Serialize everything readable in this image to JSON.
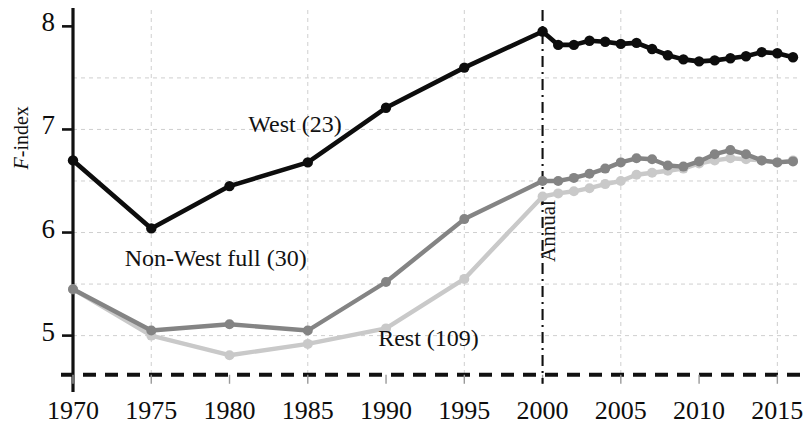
{
  "chart_data": {
    "type": "line",
    "title": "",
    "xlabel": "",
    "ylabel": "F-index",
    "ylabel_prefix": "F",
    "ylabel_suffix": "-index",
    "xlim": [
      1970,
      2016
    ],
    "ylim": [
      4.55,
      8.12
    ],
    "yticks": [
      5,
      6,
      7,
      8
    ],
    "ytick_labels": [
      "5",
      "6",
      "7",
      "8"
    ],
    "xticks": [
      1970,
      1975,
      1980,
      1985,
      1990,
      1995,
      2000,
      2005,
      2010,
      2015
    ],
    "xtick_labels": [
      "1970",
      "1975",
      "1980",
      "1985",
      "1990",
      "1995",
      "2000",
      "2005",
      "2010",
      "2015"
    ],
    "grid": true,
    "gridlines_y": [
      5.0,
      5.5,
      6.0,
      6.5,
      7.0,
      7.5
    ],
    "gridlines_x": [
      1975,
      1985,
      1995,
      2005,
      2015
    ],
    "legend_position": "inline-annotations",
    "baseline_y": 4.62,
    "annotations": [
      {
        "name": "annual-divider",
        "text": "Annual",
        "x": 2000,
        "style": "dash-dot vertical line",
        "rotation": -90
      }
    ],
    "series": [
      {
        "name": "West (23)",
        "label": "West (23)",
        "color": "#0d0d0d",
        "label_x": 1981.2,
        "label_y": 7.02,
        "x": [
          1970,
          1975,
          1980,
          1985,
          1990,
          1995,
          2000,
          2001,
          2002,
          2003,
          2004,
          2005,
          2006,
          2007,
          2008,
          2009,
          2010,
          2011,
          2012,
          2013,
          2014,
          2015,
          2016
        ],
        "values": [
          6.7,
          6.04,
          6.45,
          6.68,
          7.21,
          7.6,
          7.95,
          7.82,
          7.82,
          7.86,
          7.85,
          7.83,
          7.84,
          7.78,
          7.72,
          7.68,
          7.66,
          7.67,
          7.69,
          7.71,
          7.75,
          7.74,
          7.7
        ]
      },
      {
        "name": "Non-West full (30)",
        "label": "Non-West full (30)",
        "color": "#848484",
        "label_x": 1973.3,
        "label_y": 5.72,
        "x": [
          1970,
          1975,
          1980,
          1985,
          1990,
          1995,
          2000,
          2001,
          2002,
          2003,
          2004,
          2005,
          2006,
          2007,
          2008,
          2009,
          2010,
          2011,
          2012,
          2013,
          2014,
          2015,
          2016
        ],
        "values": [
          5.45,
          5.05,
          5.11,
          5.05,
          5.52,
          6.13,
          6.5,
          6.5,
          6.53,
          6.57,
          6.62,
          6.68,
          6.72,
          6.71,
          6.65,
          6.64,
          6.69,
          6.76,
          6.8,
          6.76,
          6.7,
          6.68,
          6.69
        ]
      },
      {
        "name": "Rest (109)",
        "label": "Rest (109)",
        "color": "#c9c9c9",
        "label_x": 1989.5,
        "label_y": 4.95,
        "x": [
          1970,
          1975,
          1980,
          1985,
          1990,
          1995,
          2000,
          2001,
          2002,
          2003,
          2004,
          2005,
          2006,
          2007,
          2008,
          2009,
          2010,
          2011,
          2012,
          2013,
          2014,
          2015,
          2016
        ],
        "values": [
          5.45,
          5.0,
          4.81,
          4.92,
          5.07,
          5.55,
          6.35,
          6.38,
          6.4,
          6.43,
          6.47,
          6.5,
          6.56,
          6.58,
          6.6,
          6.62,
          6.67,
          6.7,
          6.72,
          6.71,
          6.7,
          6.68,
          6.7
        ]
      }
    ]
  },
  "axis_style": {
    "axis_color": "#111111",
    "grid_color": "#cfcfcf",
    "baseline_color": "#111111"
  }
}
